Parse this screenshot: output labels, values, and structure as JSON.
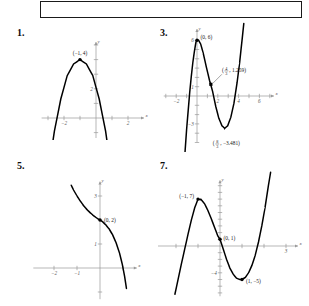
{
  "page": {
    "top_box": {
      "content": ""
    },
    "problems": [
      {
        "number": "1."
      },
      {
        "number": "3."
      },
      {
        "number": "5."
      },
      {
        "number": "7."
      }
    ]
  },
  "chart_data": [
    {
      "id": "problem-1",
      "type": "line",
      "title": "1.",
      "xlabel": "x",
      "ylabel": "y",
      "xlim": [
        -3.4,
        3.0
      ],
      "ylim": [
        -2.2,
        5.2
      ],
      "xticks": [
        -2,
        2
      ],
      "xticklabels": [
        "-2",
        "2"
      ],
      "yticks": [
        2,
        4
      ],
      "yticklabels": [
        "2",
        ""
      ],
      "grid": false,
      "legend": null,
      "annotations": [
        {
          "label": "(-1, 4)",
          "x": -1,
          "y": 4,
          "marker": "dot"
        }
      ],
      "description": "Downward-opening parabola, vertex (-1, 4)",
      "curve_points": [
        [
          -3.05,
          -4.2
        ],
        [
          -2.6,
          -0.9
        ],
        [
          -2.2,
          1.3
        ],
        [
          -1.8,
          2.9
        ],
        [
          -1.4,
          3.7
        ],
        [
          -1.0,
          4.0
        ],
        [
          -0.6,
          3.7
        ],
        [
          -0.2,
          2.9
        ],
        [
          0.2,
          1.3
        ],
        [
          0.6,
          -0.9
        ],
        [
          1.0,
          -4.0
        ],
        [
          1.2,
          -5.8
        ]
      ]
    },
    {
      "id": "problem-3",
      "type": "line",
      "title": "3.",
      "xlabel": "x",
      "ylabel": "y",
      "xlim": [
        -3.2,
        7.4
      ],
      "ylim": [
        -5.0,
        7.2
      ],
      "xticks": [
        -2,
        2,
        4,
        6
      ],
      "xticklabels": [
        "-2",
        "2",
        "4",
        "6"
      ],
      "yticks": [
        -3,
        1,
        6
      ],
      "yticklabels": [
        "-3",
        "1",
        "6"
      ],
      "grid": false,
      "legend": null,
      "annotations": [
        {
          "label": "(0, 6)",
          "x": 0,
          "y": 6,
          "marker": "dot"
        },
        {
          "label_num": "4",
          "label_den": "3",
          "label_val": "1.259",
          "x": 1.333,
          "y": 1.259,
          "marker": "square"
        },
        {
          "label_num": "8",
          "label_den": "3",
          "label_val": "-3.481",
          "x": 2.667,
          "y": -3.481,
          "marker": "none"
        }
      ],
      "description": "Cubic with local max (0,6), inflection (4/3, 1.259), local min (8/3, -3.481)",
      "curve_points": [
        [
          -1.15,
          -6.0
        ],
        [
          -1.0,
          -3.6
        ],
        [
          -0.85,
          -1.6
        ],
        [
          -0.7,
          0.4
        ],
        [
          -0.55,
          2.1
        ],
        [
          -0.4,
          3.6
        ],
        [
          -0.25,
          4.8
        ],
        [
          -0.1,
          5.8
        ],
        [
          0.0,
          6.0
        ],
        [
          0.15,
          6.0
        ],
        [
          0.35,
          5.6
        ],
        [
          0.6,
          4.6
        ],
        [
          0.9,
          3.1
        ],
        [
          1.2,
          1.7
        ],
        [
          1.5,
          0.5
        ],
        [
          1.8,
          -1.1
        ],
        [
          2.1,
          -2.4
        ],
        [
          2.4,
          -3.2
        ],
        [
          2.667,
          -3.48
        ],
        [
          2.95,
          -3.2
        ],
        [
          3.25,
          -2.3
        ],
        [
          3.55,
          -0.8
        ],
        [
          3.85,
          1.4
        ],
        [
          4.1,
          3.6
        ],
        [
          4.35,
          6.2
        ],
        [
          4.5,
          7.8
        ]
      ]
    },
    {
      "id": "problem-5",
      "type": "line",
      "title": "5.",
      "xlabel": "x",
      "ylabel": "y",
      "xlim": [
        -2.9,
        1.6
      ],
      "ylim": [
        -1.3,
        3.6
      ],
      "xticks": [
        -2,
        -1
      ],
      "xticklabels": [
        "-2",
        "-1"
      ],
      "yticks": [
        1,
        3
      ],
      "yticklabels": [
        "1",
        "3"
      ],
      "grid": false,
      "legend": null,
      "annotations": [
        {
          "label": "(0, 2)",
          "x": 0,
          "y": 2,
          "marker": "dot"
        }
      ],
      "description": "Decreasing cubic through (0, 2)",
      "curve_points": [
        [
          -1.25,
          3.45
        ],
        [
          -1.15,
          3.25
        ],
        [
          -1.0,
          3.0
        ],
        [
          -0.85,
          2.78
        ],
        [
          -0.7,
          2.58
        ],
        [
          -0.55,
          2.42
        ],
        [
          -0.4,
          2.28
        ],
        [
          -0.25,
          2.16
        ],
        [
          -0.1,
          2.05
        ],
        [
          0.0,
          2.0
        ],
        [
          0.12,
          1.92
        ],
        [
          0.25,
          1.8
        ],
        [
          0.4,
          1.62
        ],
        [
          0.55,
          1.38
        ],
        [
          0.7,
          1.05
        ],
        [
          0.85,
          0.62
        ],
        [
          0.97,
          0.15
        ],
        [
          1.07,
          -0.35
        ],
        [
          1.15,
          -0.85
        ]
      ]
    },
    {
      "id": "problem-7",
      "type": "line",
      "title": "7.",
      "xlabel": "x",
      "ylabel": "y",
      "xlim": [
        -3.4,
        4.3
      ],
      "ylim": [
        -7.5,
        9.8
      ],
      "xticks": [
        3
      ],
      "xticklabels": [
        "3"
      ],
      "yticks": [
        -4
      ],
      "yticklabels": [
        "-4"
      ],
      "grid": false,
      "legend": null,
      "annotations": [
        {
          "label": "(-1, 7)",
          "x": -1,
          "y": 7,
          "marker": "dot"
        },
        {
          "label": "(0, 1)",
          "x": 0,
          "y": 1,
          "marker": "dot"
        },
        {
          "label": "(1, -5)",
          "x": 1,
          "y": -5,
          "marker": "dot"
        }
      ],
      "description": "Cubic with local max (-1,7), y-intercept (0,1), local min (1,-5)",
      "curve_points": [
        [
          -2.05,
          -7.2
        ],
        [
          -1.9,
          -4.9
        ],
        [
          -1.75,
          -2.6
        ],
        [
          -1.6,
          -0.4
        ],
        [
          -1.45,
          1.8
        ],
        [
          -1.3,
          3.9
        ],
        [
          -1.15,
          5.7
        ],
        [
          -1.0,
          7.0
        ],
        [
          -0.85,
          6.9
        ],
        [
          -0.7,
          6.3
        ],
        [
          -0.55,
          5.3
        ],
        [
          -0.4,
          4.1
        ],
        [
          -0.25,
          2.8
        ],
        [
          -0.1,
          1.5
        ],
        [
          0.0,
          1.0
        ],
        [
          0.15,
          -0.5
        ],
        [
          0.3,
          -2.0
        ],
        [
          0.45,
          -3.3
        ],
        [
          0.6,
          -4.2
        ],
        [
          0.75,
          -4.8
        ],
        [
          0.9,
          -5.0
        ],
        [
          1.0,
          -5.0
        ],
        [
          1.15,
          -4.7
        ],
        [
          1.3,
          -4.0
        ],
        [
          1.45,
          -2.9
        ],
        [
          1.6,
          -1.4
        ],
        [
          1.75,
          0.6
        ],
        [
          1.9,
          3.0
        ],
        [
          2.05,
          5.8
        ],
        [
          2.2,
          9.0
        ],
        [
          2.3,
          11.0
        ]
      ]
    }
  ]
}
